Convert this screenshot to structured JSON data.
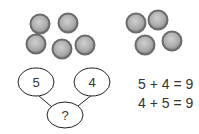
{
  "counters": {
    "left_group": [
      {
        "cx": 40,
        "cy": 24
      },
      {
        "cx": 68,
        "cy": 23
      },
      {
        "cx": 36,
        "cy": 44
      },
      {
        "cx": 62,
        "cy": 49
      },
      {
        "cx": 85,
        "cy": 45
      }
    ],
    "right_group": [
      {
        "cx": 136,
        "cy": 23
      },
      {
        "cx": 158,
        "cy": 20
      },
      {
        "cx": 145,
        "cy": 45
      },
      {
        "cx": 172,
        "cy": 41
      }
    ],
    "radius": 9.5
  },
  "number_bond": {
    "part_left": "5",
    "part_right": "4",
    "whole": "?"
  },
  "equations": [
    "5 + 4 = 9",
    "4 + 5 = 9"
  ],
  "colors": {
    "counter_rim": "#6b6b6b",
    "counter_fill_light": "#c8c8c8",
    "counter_fill_dark": "#8e8e8e",
    "stroke": "#222222",
    "text": "#333333"
  }
}
